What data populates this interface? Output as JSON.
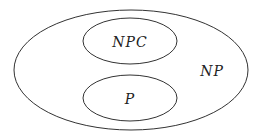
{
  "diagram": {
    "type": "venn",
    "stroke_color": "#333333",
    "sets": [
      {
        "id": "np",
        "label": "NP",
        "cx": 131,
        "cy": 70,
        "rx": 117,
        "ry": 60,
        "label_x": 212,
        "label_y": 76
      },
      {
        "id": "npc",
        "label": "NPC",
        "cx": 130,
        "cy": 41,
        "rx": 47,
        "ry": 23,
        "label_x": 130,
        "label_y": 47
      },
      {
        "id": "p",
        "label": "P",
        "cx": 130,
        "cy": 98,
        "rx": 47,
        "ry": 23,
        "label_x": 130,
        "label_y": 104
      }
    ]
  }
}
